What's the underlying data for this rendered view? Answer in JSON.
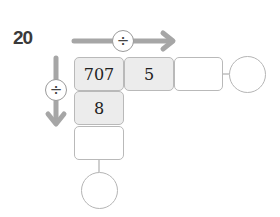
{
  "problem": {
    "number": "20"
  },
  "operations": {
    "horizontal": {
      "symbol": "÷",
      "direction": "right"
    },
    "vertical": {
      "symbol": "÷",
      "direction": "down"
    }
  },
  "grid": {
    "top_row": [
      "707",
      "5",
      ""
    ],
    "left_column": [
      "707",
      "8",
      ""
    ],
    "result_circles": {
      "row_result": "",
      "column_result": ""
    }
  },
  "colors": {
    "arrow": "#a6a6a6",
    "cell_border": "#b9b9b9",
    "filled_cell_bg": "#ececec",
    "label": "#3a3a3a"
  }
}
